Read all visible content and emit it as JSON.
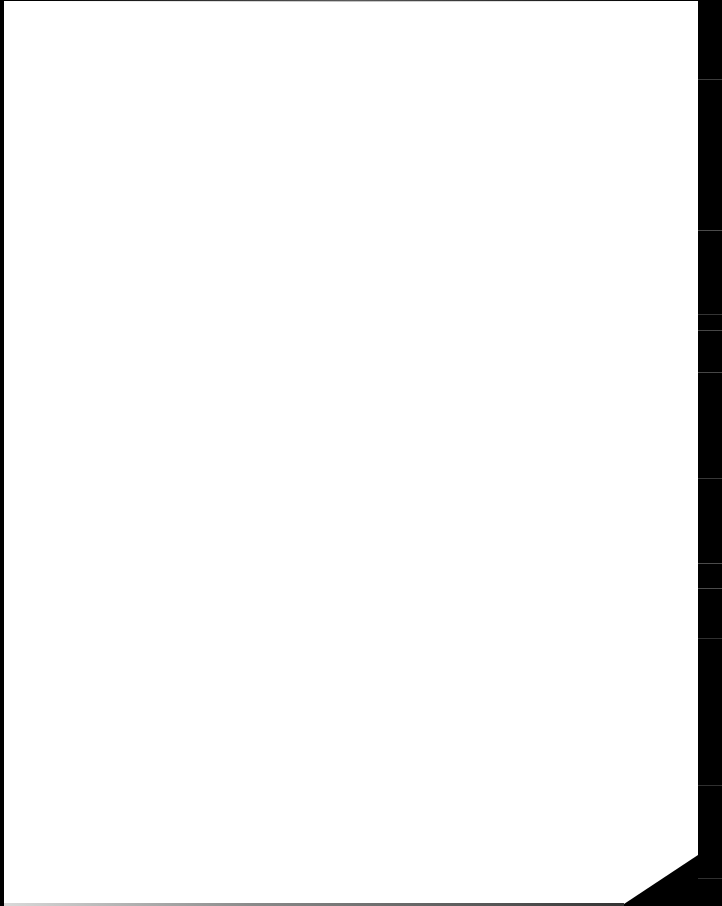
{
  "document": {
    "page_color": "#ffffff",
    "background_color": "#000000",
    "text_content": ""
  }
}
